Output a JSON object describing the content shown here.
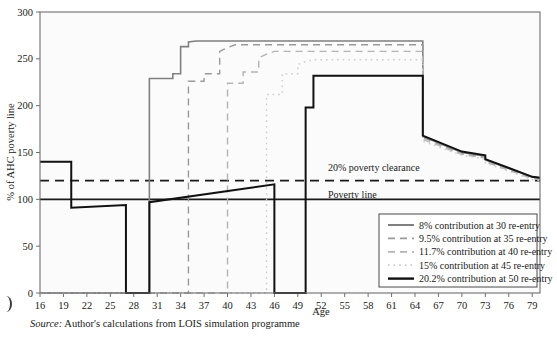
{
  "chart_data": {
    "type": "line",
    "title": "",
    "xlabel": "Age",
    "ylabel": "% of AHC poverty line",
    "xlim": [
      16,
      80
    ],
    "ylim": [
      0,
      300
    ],
    "xticks": [
      16,
      19,
      22,
      25,
      28,
      31,
      34,
      37,
      40,
      43,
      46,
      49,
      52,
      55,
      58,
      61,
      64,
      67,
      70,
      73,
      76,
      79
    ],
    "yticks": [
      0,
      50,
      100,
      150,
      200,
      250,
      300
    ],
    "grid": false,
    "legend_position": "bottom-right",
    "annotations": [
      {
        "name": "poverty-clearance-line",
        "label": "20% poverty clearance",
        "value": 120,
        "style": "dashed"
      },
      {
        "name": "poverty-line",
        "label": "Poverty line",
        "value": 100,
        "style": "solid"
      }
    ],
    "series": [
      {
        "name": "8% contribution at 30 re-entry",
        "color": "#808080",
        "style": "solid",
        "width": 1.6,
        "reentry_age": 30,
        "points": [
          [
            16,
            0
          ],
          [
            30,
            0
          ],
          [
            30,
            229
          ],
          [
            33,
            229
          ],
          [
            33,
            234
          ],
          [
            34,
            234
          ],
          [
            34,
            263
          ],
          [
            35,
            263
          ],
          [
            35,
            268
          ],
          [
            36,
            269
          ],
          [
            64,
            269
          ],
          [
            65,
            269
          ],
          [
            65,
            167
          ],
          [
            70,
            150
          ],
          [
            73,
            146
          ],
          [
            73,
            142
          ],
          [
            79,
            124
          ],
          [
            80,
            123
          ]
        ]
      },
      {
        "name": "9.5% contribution at 35 re-entry",
        "color": "#9a9a9a",
        "style": "dashed",
        "width": 1.4,
        "reentry_age": 35,
        "points": [
          [
            16,
            0
          ],
          [
            35,
            0
          ],
          [
            35,
            226
          ],
          [
            37,
            226
          ],
          [
            37,
            234
          ],
          [
            39,
            234
          ],
          [
            39,
            258
          ],
          [
            40,
            262
          ],
          [
            41,
            265
          ],
          [
            64,
            265
          ],
          [
            65,
            265
          ],
          [
            65,
            166
          ],
          [
            70,
            149
          ],
          [
            73,
            145
          ],
          [
            73,
            141
          ],
          [
            79,
            123
          ],
          [
            80,
            122
          ]
        ]
      },
      {
        "name": "11.7% contribution at 40 re-entry",
        "color": "#b4b4b4",
        "style": "dashed",
        "width": 1.4,
        "reentry_age": 40,
        "points": [
          [
            16,
            0
          ],
          [
            40,
            0
          ],
          [
            40,
            224
          ],
          [
            42,
            224
          ],
          [
            42,
            236
          ],
          [
            44,
            236
          ],
          [
            44,
            251
          ],
          [
            45,
            255
          ],
          [
            46,
            258
          ],
          [
            64,
            258
          ],
          [
            65,
            258
          ],
          [
            65,
            164
          ],
          [
            70,
            148
          ],
          [
            73,
            144
          ],
          [
            73,
            140
          ],
          [
            79,
            122
          ],
          [
            80,
            121
          ]
        ]
      },
      {
        "name": "15% contribution at 45 re-entry",
        "color": "#cccccc",
        "style": "dotted",
        "width": 1.4,
        "reentry_age": 45,
        "points": [
          [
            16,
            0
          ],
          [
            45,
            0
          ],
          [
            45,
            212
          ],
          [
            47,
            212
          ],
          [
            47,
            234
          ],
          [
            49,
            234
          ],
          [
            49,
            244
          ],
          [
            50,
            247
          ],
          [
            51,
            249
          ],
          [
            64,
            249
          ],
          [
            65,
            249
          ],
          [
            65,
            162
          ],
          [
            70,
            147
          ],
          [
            73,
            143
          ],
          [
            73,
            139
          ],
          [
            79,
            121
          ],
          [
            80,
            120
          ]
        ]
      },
      {
        "name": "20.2% contribution at 50 re-entry",
        "color": "#111111",
        "style": "solid",
        "width": 2.0,
        "reentry_age": 50,
        "points": [
          [
            16,
            140
          ],
          [
            20,
            140
          ],
          [
            20,
            91
          ],
          [
            27,
            94
          ],
          [
            27,
            0
          ],
          [
            30,
            0
          ],
          [
            30,
            97
          ],
          [
            46,
            116
          ],
          [
            46,
            0
          ],
          [
            50,
            0
          ],
          [
            50,
            198
          ],
          [
            51,
            198
          ],
          [
            51,
            232
          ],
          [
            64,
            232
          ],
          [
            65,
            232
          ],
          [
            65,
            168
          ],
          [
            70,
            151
          ],
          [
            73,
            147
          ],
          [
            73,
            143
          ],
          [
            79,
            124
          ],
          [
            80,
            123
          ]
        ]
      }
    ]
  },
  "legend": {
    "items": [
      {
        "label": "8% contribution at 30 re-entry"
      },
      {
        "label": "9.5% contribution at 35 re-entry"
      },
      {
        "label": "11.7% contribution at 40 re-entry"
      },
      {
        "label": "15% contribution at 45 re-entry"
      },
      {
        "label": "20.2% contribution at 50 re-entry"
      }
    ]
  },
  "source_note": {
    "prefix": "Source:",
    "text": "Author's calculations from LOIS simulation programme"
  }
}
